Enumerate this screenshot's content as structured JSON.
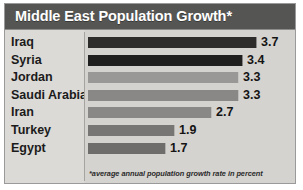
{
  "header": {
    "title": "Middle East Population Growth*",
    "background_color": "#555553",
    "text_color": "#ffffff"
  },
  "footnote": {
    "text": "*average annual population growth rate in percent"
  },
  "chart_data": {
    "type": "bar",
    "orientation": "horizontal",
    "title": "Middle East Population Growth*",
    "xlabel": "",
    "ylabel": "",
    "xlim": [
      0,
      3.7
    ],
    "grid": false,
    "legend": "none",
    "annotations": [
      "*average annual population growth rate in percent"
    ],
    "categories": [
      "Iraq",
      "Syria",
      "Jordan",
      "Saudi Arabia",
      "Iran",
      "Turkey",
      "Egypt"
    ],
    "values": [
      3.7,
      3.4,
      3.3,
      3.3,
      2.7,
      1.9,
      1.7
    ],
    "value_labels": [
      "3.7",
      "3.4",
      "3.3",
      "3.3",
      "2.7",
      "1.9",
      "1.7"
    ],
    "bar_colors": [
      "#2d2c2b",
      "#201f1f",
      "#9a9896",
      "#8a8886",
      "#8a8886",
      "#787674",
      "#6f6d6b"
    ]
  }
}
